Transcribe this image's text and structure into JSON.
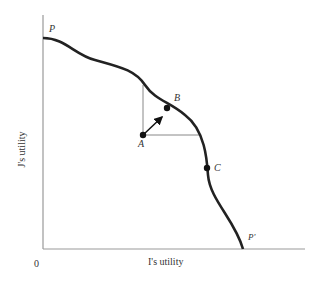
{
  "figure": {
    "x_axis_label": "I's utility",
    "y_axis_label": "J's utility",
    "origin_label": "0",
    "points": {
      "P": "P",
      "P_prime": "P'",
      "A": "A",
      "B": "B",
      "C": "C"
    },
    "colors": {
      "curve": "#222222",
      "axis": "#888888",
      "guide": "#888888"
    }
  }
}
